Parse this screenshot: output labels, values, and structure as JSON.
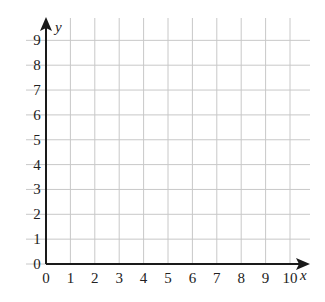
{
  "diagram": {
    "type": "coordinate-grid",
    "x_axis": {
      "label": "x",
      "min": 0,
      "max": 10,
      "ticks": [
        "0",
        "1",
        "2",
        "3",
        "4",
        "5",
        "6",
        "7",
        "8",
        "9",
        "10"
      ]
    },
    "y_axis": {
      "label": "y",
      "min": 0,
      "max": 9,
      "ticks": [
        "0",
        "1",
        "2",
        "3",
        "4",
        "5",
        "6",
        "7",
        "8",
        "9"
      ]
    },
    "grid": true,
    "colors": {
      "grid": "#c8c8c8",
      "axis": "#1a1a1a",
      "text": "#222222"
    }
  }
}
